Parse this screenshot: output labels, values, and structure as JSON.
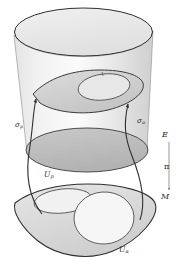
{
  "figure": {
    "background_color": "#ffffff",
    "stroke_color": "#2f2f2f",
    "fill_light": "#ededed",
    "fill_mid": "#d9d9d9",
    "fill_dark": "#b8b8b8",
    "width": 183,
    "height": 266
  },
  "labels": {
    "total_space": "E",
    "projection": "π",
    "base_space": "M",
    "section_p": {
      "symbol": "σ",
      "subscript": "p"
    },
    "section_alpha": {
      "symbol": "σ",
      "subscript": "α"
    },
    "neighborhood_p": {
      "symbol": "U",
      "subscript": "p"
    },
    "neighborhood_alpha": {
      "symbol": "U",
      "subscript": "α"
    }
  },
  "parts": {
    "cylinder": "total-space-cylinder",
    "cylinder_top": "cylinder-top-ellipse",
    "cylinder_bottom": "cylinder-bottom-ellipse",
    "section_surface": "section-surface-upper",
    "section_inner_oval": "section-surface-inner-oval",
    "base_surface": "base-manifold-surface",
    "base_oval_left": "base-neighborhood-up",
    "base_oval_right": "base-neighborhood-ualpha",
    "arrow_left": "section-arrow-p",
    "arrow_right": "section-arrow-alpha",
    "projection_arrow": "projection-arrow"
  }
}
